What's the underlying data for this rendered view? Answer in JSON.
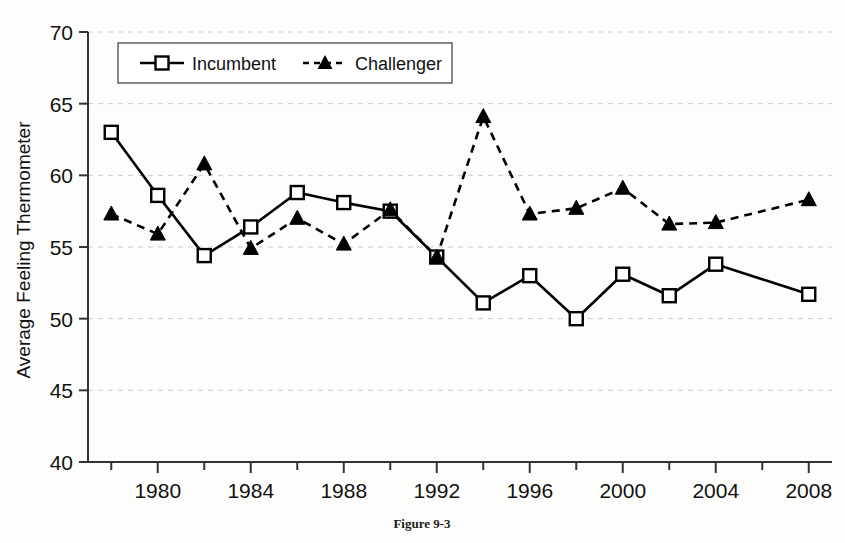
{
  "figure": {
    "caption": "Figure 9-3"
  },
  "chart_data": {
    "type": "line",
    "title": "",
    "xlabel": "",
    "ylabel": "Average Feeling Thermometer",
    "xlim": [
      1977,
      2009
    ],
    "ylim": [
      40,
      70
    ],
    "yticks": [
      40,
      45,
      50,
      55,
      60,
      65,
      70
    ],
    "xticks": [
      1978,
      1980,
      1982,
      1984,
      1986,
      1988,
      1990,
      1992,
      1994,
      1996,
      1998,
      2000,
      2002,
      2004,
      2006,
      2008
    ],
    "xtick_labels": [
      "",
      "1980",
      "",
      "1984",
      "",
      "1988",
      "",
      "1992",
      "",
      "1996",
      "",
      "2000",
      "",
      "2004",
      "",
      "2008"
    ],
    "grid": true,
    "grid_axis": "y",
    "legend_position": "top-center",
    "x": [
      1978,
      1980,
      1982,
      1984,
      1986,
      1988,
      1990,
      1992,
      1994,
      1996,
      1998,
      2000,
      2002,
      2004,
      2006,
      2008
    ],
    "series": [
      {
        "name": "Incumbent",
        "marker": "open-square",
        "linestyle": "solid",
        "color": "#000000",
        "values": [
          63.0,
          58.6,
          54.4,
          56.4,
          58.8,
          58.1,
          57.5,
          54.3,
          51.1,
          53.0,
          50.0,
          53.1,
          51.6,
          53.8,
          null,
          51.7
        ]
      },
      {
        "name": "Challenger",
        "marker": "filled-triangle",
        "linestyle": "dashed",
        "color": "#000000",
        "values": [
          57.3,
          55.9,
          60.8,
          54.9,
          57.0,
          55.2,
          57.6,
          54.3,
          64.1,
          57.3,
          57.7,
          59.1,
          56.6,
          56.7,
          null,
          58.3
        ]
      }
    ]
  },
  "legend": {
    "items": [
      {
        "label": "Incumbent",
        "marker": "open-square",
        "linestyle": "solid"
      },
      {
        "label": "Challenger",
        "marker": "filled-triangle",
        "linestyle": "dashed"
      }
    ]
  },
  "colors": {
    "ink": "#111111",
    "grid": "#cccccc",
    "axis": "#333333",
    "background": "#fdfdfb"
  }
}
